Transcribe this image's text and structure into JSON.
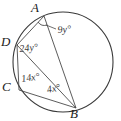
{
  "figure": {
    "kind": "circle-geometry-diagram",
    "background_color": "#ffffff",
    "stroke_color": "#3a3a3a",
    "label_color": "#1b1b1b",
    "angle_label_color": "#3a3a3a"
  },
  "circle": {
    "center_x": 63,
    "center_y": 62,
    "radius": 50
  },
  "points": [
    {
      "id": "A",
      "label": "A",
      "x": 44,
      "y": 16,
      "label_x": 31,
      "label_y": 1
    },
    {
      "id": "D",
      "label": "D",
      "x": 17,
      "y": 45,
      "label_x": 1,
      "label_y": 35
    },
    {
      "id": "C",
      "label": "C",
      "x": 19,
      "y": 90,
      "label_x": 2,
      "label_y": 80
    },
    {
      "id": "B",
      "label": "B",
      "x": 76,
      "y": 108,
      "label_x": 70,
      "label_y": 107
    }
  ],
  "chords": [
    {
      "id": "AB",
      "from": "A",
      "to": "B"
    },
    {
      "id": "AD",
      "from": "A",
      "to": "D"
    },
    {
      "id": "DC",
      "from": "D",
      "to": "C"
    },
    {
      "id": "DB",
      "from": "D",
      "to": "B"
    },
    {
      "id": "CB",
      "from": "C",
      "to": "B"
    }
  ],
  "angles": [
    {
      "id": "angle-9y",
      "value": "9y",
      "unit": "°",
      "text": "9y°",
      "vertex": "A",
      "label_x": 58,
      "label_y": 25,
      "leader": {
        "x1": 55,
        "y1": 30,
        "x2": 42,
        "y2": 24
      }
    },
    {
      "id": "angle-24y",
      "value": "24y",
      "unit": "°",
      "text": "24y°",
      "vertex": "D",
      "label_x": 20,
      "label_y": 44
    },
    {
      "id": "angle-14x",
      "value": "14x",
      "unit": "°",
      "text": "14x°",
      "vertex": "C",
      "label_x": 22,
      "label_y": 74
    },
    {
      "id": "angle-4x",
      "value": "4x",
      "unit": "°",
      "text": "4x°",
      "vertex": "B",
      "label_x": 48,
      "label_y": 85
    }
  ],
  "angle_marks": [
    {
      "id": "arc-at-A",
      "vertex": "A",
      "description": "small arc mark at vertex A between chord AD and chord AB"
    }
  ]
}
